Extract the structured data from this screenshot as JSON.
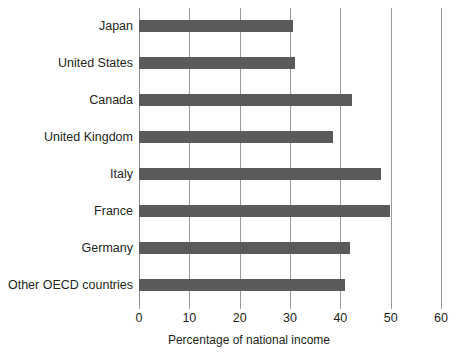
{
  "chart_data": {
    "type": "bar",
    "orientation": "horizontal",
    "title": "",
    "subtitle": "",
    "xlabel": "Percentage of national income",
    "ylabel": "",
    "xlim": [
      0,
      60
    ],
    "xticks": [
      0,
      10,
      20,
      30,
      40,
      50,
      60
    ],
    "xtick_labels": [
      "0",
      "10",
      "20",
      "30",
      "40",
      "50",
      "60"
    ],
    "grid": "vertical",
    "legend": "none",
    "bar_color": "#5a5a5c",
    "gridline_color": "#9a9a9a",
    "background_color": "#ffffff",
    "categories": [
      "Japan",
      "United States",
      "Canada",
      "United Kingdom",
      "Italy",
      "France",
      "Germany",
      "Other OECD countries"
    ],
    "values": [
      30.5,
      31.0,
      42.3,
      38.6,
      48.0,
      49.8,
      42.0,
      41.0
    ],
    "series": [
      {
        "name": "Percentage of national income",
        "values": [
          30.5,
          31.0,
          42.3,
          38.6,
          48.0,
          49.8,
          42.0,
          41.0
        ]
      }
    ]
  }
}
